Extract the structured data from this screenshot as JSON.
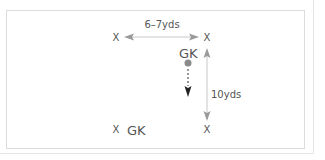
{
  "diagram": {
    "players": [
      {
        "label": "X",
        "x": 116,
        "y": 37
      },
      {
        "label": "X",
        "x": 207,
        "y": 37
      },
      {
        "label": "X",
        "x": 116,
        "y": 129
      },
      {
        "label": "X",
        "x": 207,
        "y": 129
      }
    ],
    "goalkeepers": [
      {
        "label": "GK",
        "x": 188,
        "y": 54
      },
      {
        "label": "GK",
        "x": 145,
        "y": 130
      }
    ],
    "distances": {
      "horizontal": "6–7yds",
      "vertical": "10yds"
    },
    "ball_color": "#8a8a8a",
    "arrow_color": "#aaaaaa",
    "dashed_arrow_color": "#333333"
  }
}
